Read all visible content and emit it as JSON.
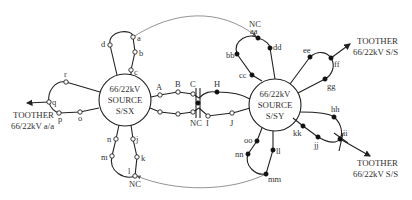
{
  "diagram": {
    "title": "",
    "sources": [
      {
        "id": "sx",
        "lines": [
          "66/22kV",
          "SOURCE",
          "S/SX"
        ]
      },
      {
        "id": "sy",
        "lines": [
          "66/22kV",
          "SOURCE",
          "S/SY"
        ]
      }
    ],
    "external_links": [
      {
        "id": "left",
        "lines": [
          "TOOTHER",
          "66/22kV a/a"
        ]
      },
      {
        "id": "right_top",
        "lines": [
          "TOOTHER",
          "66/22kV S/S"
        ]
      },
      {
        "id": "right_bottom",
        "lines": [
          "TOOTHER",
          "66/22kV S/S"
        ]
      }
    ],
    "normally_closed_label": "NC",
    "switch_legend": {
      "open_circle": "switch on S/SX feeders",
      "filled_dot": "switch on S/SY feeders"
    },
    "nodes": {
      "sx_feeders": [
        "a",
        "b",
        "c",
        "d",
        "r",
        "q",
        "p",
        "o",
        "n",
        "m",
        "l",
        "k",
        "j",
        "A",
        "B",
        "C"
      ],
      "sy_feeders": [
        "aa",
        "bb",
        "cc",
        "dd",
        "ee",
        "ff",
        "gg",
        "hh",
        "ii",
        "jj",
        "kk",
        "ll",
        "mm",
        "nn",
        "oo",
        "H"
      ],
      "tie_lower": [
        "I",
        "J"
      ]
    },
    "labels": {
      "a": "a",
      "b": "b",
      "c": "c",
      "d": "d",
      "r": "r",
      "q": "q",
      "p": "p",
      "o": "o",
      "n": "n",
      "m": "m",
      "l": "l",
      "k": "k",
      "j": "j",
      "A": "A",
      "B": "B",
      "C": "C",
      "H": "H",
      "I": "I",
      "J": "J",
      "aa": "aa",
      "bb": "bb",
      "cc": "cc",
      "dd": "dd",
      "ee": "ee",
      "ff": "ff",
      "gg": "gg",
      "hh": "hh",
      "ii": "ii",
      "jj": "jj",
      "kk": "kk",
      "ll": "ll",
      "mm": "mm",
      "nn": "nn",
      "oo": "oo"
    },
    "nc_points": [
      "top tie at aa",
      "middle tie at C/I",
      "bottom tie at l"
    ]
  }
}
